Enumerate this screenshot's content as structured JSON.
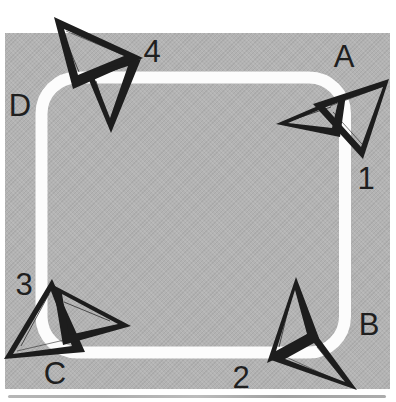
{
  "colors": {
    "page_background": "#ffffff",
    "field_gray": "#b3b3b3",
    "track_white": "#fcfcfc",
    "dart_dark": "#1d1d1d",
    "label_text": "#1f1f1f"
  },
  "labels": [
    {
      "id": "4",
      "text": "4"
    },
    {
      "id": "A",
      "text": "A"
    },
    {
      "id": "D",
      "text": "D"
    },
    {
      "id": "1",
      "text": "1"
    },
    {
      "id": "3",
      "text": "3"
    },
    {
      "id": "B",
      "text": "B"
    },
    {
      "id": "C",
      "text": "C"
    },
    {
      "id": "2",
      "text": "2"
    }
  ]
}
